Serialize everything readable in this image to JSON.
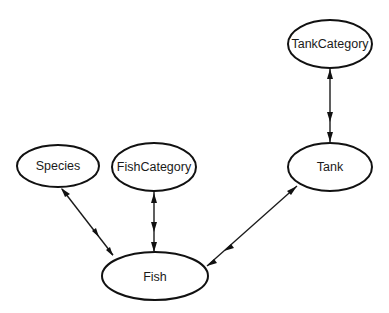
{
  "diagram": {
    "type": "entity-relationship",
    "nodes": [
      {
        "id": "species",
        "label": "Species",
        "cx": 58,
        "cy": 166,
        "rx": 41,
        "ry": 21
      },
      {
        "id": "fishcategory",
        "label": "FishCategory",
        "cx": 154,
        "cy": 167,
        "rx": 42,
        "ry": 24
      },
      {
        "id": "tankcategory",
        "label": "TankCategory",
        "cx": 330,
        "cy": 44,
        "rx": 42,
        "ry": 24
      },
      {
        "id": "tank",
        "label": "Tank",
        "cx": 330,
        "cy": 167,
        "rx": 42,
        "ry": 24
      },
      {
        "id": "fish",
        "label": "Fish",
        "cx": 155,
        "cy": 276,
        "rx": 53,
        "ry": 24
      }
    ],
    "edges": [
      {
        "from": "species",
        "to": "fish",
        "from_end": "one",
        "to_end": "many"
      },
      {
        "from": "fishcategory",
        "to": "fish",
        "from_end": "one",
        "to_end": "many"
      },
      {
        "from": "tank",
        "to": "fish",
        "from_end": "one",
        "to_end": "many"
      },
      {
        "from": "tankcategory",
        "to": "tank",
        "from_end": "one",
        "to_end": "many"
      }
    ],
    "colors": {
      "stroke": "#111111",
      "background": "#ffffff"
    }
  }
}
